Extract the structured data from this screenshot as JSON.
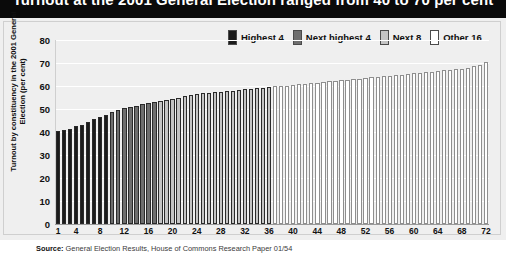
{
  "title": "Turnout at the 2001 General Election ranged from 40 to 70 per cent",
  "legend": {
    "position": "top-right",
    "items": [
      {
        "label": "Highest 4",
        "color": "#1b1b1b"
      },
      {
        "label": "Next highest 4",
        "color": "#6e6e6e"
      },
      {
        "label": "Next 8",
        "color": "#c4c4c4"
      },
      {
        "label": "Other 16",
        "color": "#ffffff"
      }
    ]
  },
  "source": {
    "prefix": "Source:",
    "text": " General Election Results, House of Commons Research Paper 01/54"
  },
  "chart_data": {
    "type": "bar",
    "title": "Turnout at the 2001 General Election ranged from 40 to 70 per cent",
    "xlabel": "",
    "ylabel": "Turnout by constituency in the 2001 General Election (per cent)",
    "ylim": [
      0,
      80
    ],
    "yticks": [
      0,
      10,
      20,
      30,
      40,
      50,
      60,
      70,
      80
    ],
    "xticks": [
      1,
      4,
      8,
      12,
      16,
      20,
      24,
      28,
      32,
      36,
      40,
      44,
      48,
      52,
      56,
      60,
      64,
      68,
      72
    ],
    "grid": true,
    "legend_position": "top-right",
    "categories": [
      1,
      2,
      3,
      4,
      5,
      6,
      7,
      8,
      9,
      10,
      11,
      12,
      13,
      14,
      15,
      16,
      17,
      18,
      19,
      20,
      21,
      22,
      23,
      24,
      25,
      26,
      27,
      28,
      29,
      30,
      31,
      32,
      33,
      34,
      35,
      36,
      37,
      38,
      39,
      40,
      41,
      42,
      43,
      44,
      45,
      46,
      47,
      48,
      49,
      50,
      51,
      52,
      53,
      54,
      55,
      56,
      57,
      58,
      59,
      60,
      61,
      62,
      63,
      64,
      65,
      66,
      67,
      68,
      69,
      70,
      71,
      72
    ],
    "values": [
      40.5,
      41.0,
      41.5,
      42.5,
      43.0,
      44.5,
      45.5,
      46.5,
      47.5,
      48.5,
      49.5,
      50.5,
      51.0,
      51.5,
      52.0,
      52.5,
      53.0,
      53.5,
      54.0,
      54.5,
      55.0,
      55.5,
      56.0,
      56.5,
      56.8,
      57.0,
      57.2,
      57.5,
      57.8,
      58.0,
      58.2,
      58.5,
      58.8,
      59.0,
      59.2,
      59.5,
      59.8,
      60.0,
      60.2,
      60.5,
      60.8,
      61.0,
      61.2,
      61.5,
      61.8,
      62.0,
      62.2,
      62.5,
      62.8,
      63.0,
      63.2,
      63.5,
      63.8,
      64.0,
      64.2,
      64.5,
      64.8,
      65.0,
      65.2,
      65.5,
      65.8,
      66.0,
      66.2,
      66.5,
      66.8,
      67.0,
      67.3,
      67.6,
      68.0,
      68.5,
      69.2,
      70.3
    ],
    "bar_colors": [
      "#1b1b1b",
      "#1b1b1b",
      "#1b1b1b",
      "#1b1b1b",
      "#1b1b1b",
      "#1b1b1b",
      "#1b1b1b",
      "#1b1b1b",
      "#1b1b1b",
      "#6e6e6e",
      "#6e6e6e",
      "#6e6e6e",
      "#6e6e6e",
      "#6e6e6e",
      "#6e6e6e",
      "#6e6e6e",
      "#6e6e6e",
      "#c4c4c4",
      "#c4c4c4",
      "#c4c4c4",
      "#c4c4c4",
      "#c4c4c4",
      "#c4c4c4",
      "#c4c4c4",
      "#c4c4c4",
      "#c4c4c4",
      "#c4c4c4",
      "#c4c4c4",
      "#c4c4c4",
      "#c4c4c4",
      "#c4c4c4",
      "#c4c4c4",
      "#c4c4c4",
      "#c4c4c4",
      "#c4c4c4",
      "#c4c4c4",
      "#ffffff",
      "#ffffff",
      "#ffffff",
      "#ffffff",
      "#ffffff",
      "#ffffff",
      "#ffffff",
      "#ffffff",
      "#ffffff",
      "#ffffff",
      "#ffffff",
      "#ffffff",
      "#ffffff",
      "#ffffff",
      "#ffffff",
      "#ffffff",
      "#ffffff",
      "#ffffff",
      "#ffffff",
      "#ffffff",
      "#ffffff",
      "#ffffff",
      "#ffffff",
      "#ffffff",
      "#ffffff",
      "#ffffff",
      "#ffffff",
      "#ffffff",
      "#ffffff",
      "#ffffff",
      "#ffffff",
      "#ffffff",
      "#ffffff",
      "#ffffff",
      "#ffffff",
      "#ffffff"
    ]
  }
}
